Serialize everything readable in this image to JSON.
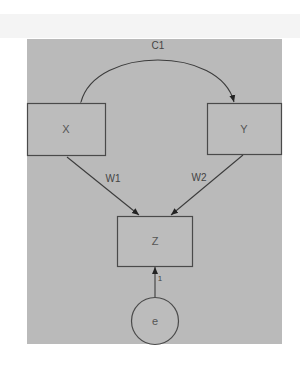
{
  "diagram": {
    "type": "path-diagram",
    "background_color": "#bababa",
    "nodes": [
      {
        "id": "X",
        "label": "X",
        "shape": "rectangle"
      },
      {
        "id": "Y",
        "label": "Y",
        "shape": "rectangle"
      },
      {
        "id": "Z",
        "label": "Z",
        "shape": "rectangle"
      },
      {
        "id": "e",
        "label": "e",
        "shape": "circle"
      }
    ],
    "edges": [
      {
        "from": "X",
        "to": "Y",
        "label": "C1",
        "type": "double-headed-curve"
      },
      {
        "from": "X",
        "to": "Z",
        "label": "W1",
        "type": "directed"
      },
      {
        "from": "Y",
        "to": "Z",
        "label": "W2",
        "type": "directed"
      },
      {
        "from": "e",
        "to": "Z",
        "label": "1",
        "type": "directed"
      }
    ]
  }
}
